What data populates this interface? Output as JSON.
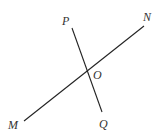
{
  "diagram": {
    "type": "intersecting-lines",
    "lines": [
      {
        "name": "MN",
        "from": "M",
        "to": "N"
      },
      {
        "name": "PQ",
        "from": "P",
        "to": "Q"
      }
    ],
    "points": {
      "P": {
        "label": "P"
      },
      "N": {
        "label": "N"
      },
      "O": {
        "label": "O"
      },
      "M": {
        "label": "M"
      },
      "Q": {
        "label": "Q"
      }
    },
    "intersection": "O"
  }
}
